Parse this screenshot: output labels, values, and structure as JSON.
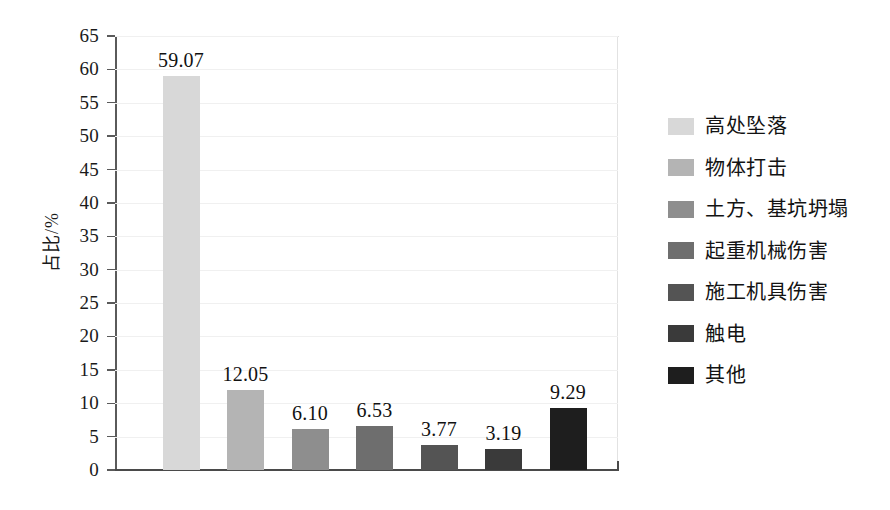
{
  "chart_data": {
    "type": "bar",
    "title": "",
    "xlabel": "",
    "ylabel": "占比/%",
    "ylim": [
      0,
      65
    ],
    "ytick_step": 5,
    "yticks": [
      "65",
      "60",
      "55",
      "50",
      "45",
      "40",
      "35",
      "30",
      "25",
      "20",
      "15",
      "10",
      "5",
      "0"
    ],
    "grid": true,
    "grid_axis": "y",
    "legend_position": "right",
    "categories": [
      "高处坠落",
      "物体打击",
      "土方、基坑坍塌",
      "起重机械伤害",
      "施工机具伤害",
      "触电",
      "其他"
    ],
    "values": [
      59.07,
      12.05,
      6.1,
      6.53,
      3.77,
      3.19,
      9.29
    ],
    "value_labels": [
      "59.07",
      "12.05",
      "6.10",
      "6.53",
      "3.77",
      "3.19",
      "9.29"
    ],
    "colors": [
      "#d8d8d8",
      "#b4b4b4",
      "#8e8e8e",
      "#6e6e6e",
      "#545454",
      "#3a3a3a",
      "#1e1e1e"
    ],
    "x_tick_labels": []
  },
  "legend": {
    "items": [
      {
        "label": "高处坠落",
        "color": "#d8d8d8"
      },
      {
        "label": "物体打击",
        "color": "#b4b4b4"
      },
      {
        "label": "土方、基坑坍塌",
        "color": "#8e8e8e"
      },
      {
        "label": "起重机械伤害",
        "color": "#6e6e6e"
      },
      {
        "label": "施工机具伤害",
        "color": "#545454"
      },
      {
        "label": "触电",
        "color": "#3a3a3a"
      },
      {
        "label": "其他",
        "color": "#1e1e1e"
      }
    ]
  },
  "axis": {
    "y_title": "占比/%"
  }
}
